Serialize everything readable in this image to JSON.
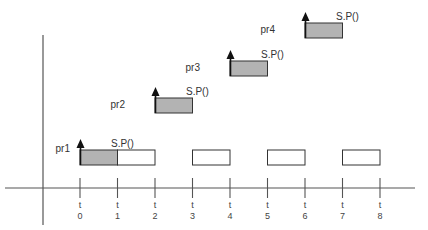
{
  "colors": {
    "axis": "#555555",
    "box_stroke": "#333333",
    "executed_fill": "#b3b3b3",
    "idle_fill": "#ffffff",
    "arrow": "#111111",
    "text": "#333333"
  },
  "axis": {
    "tick_prefix": "t",
    "ticks": [
      "0",
      "1",
      "2",
      "3",
      "4",
      "5",
      "6",
      "7",
      "8"
    ]
  },
  "processes": [
    {
      "label": "pr1",
      "release_label": "S.P()",
      "release_time": 0,
      "slots": [
        {
          "start": 0,
          "end": 1,
          "state": "executed"
        },
        {
          "start": 1,
          "end": 2,
          "state": "idle"
        },
        {
          "start": 3,
          "end": 4,
          "state": "idle"
        },
        {
          "start": 5,
          "end": 6,
          "state": "idle"
        },
        {
          "start": 7,
          "end": 8,
          "state": "idle"
        }
      ]
    },
    {
      "label": "pr2",
      "release_label": "S.P()",
      "release_time": 2,
      "slots": [
        {
          "start": 2,
          "end": 3,
          "state": "executed"
        }
      ]
    },
    {
      "label": "pr3",
      "release_label": "S.P()",
      "release_time": 4,
      "slots": [
        {
          "start": 4,
          "end": 5,
          "state": "executed"
        }
      ]
    },
    {
      "label": "pr4",
      "release_label": "S.P()",
      "release_time": 6,
      "slots": [
        {
          "start": 6,
          "end": 7,
          "state": "executed"
        }
      ]
    }
  ]
}
